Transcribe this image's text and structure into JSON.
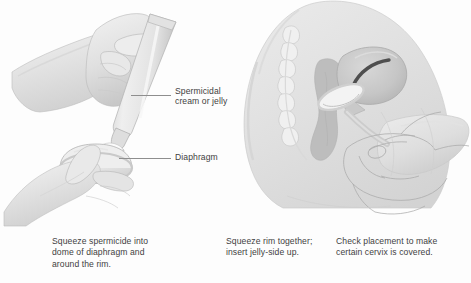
{
  "figure": {
    "style": {
      "background": "#fdfdfd",
      "text_color": "#3f3f3f",
      "leader_line_color": "#8e8e8e",
      "skin_tone_light": "#ededed",
      "skin_tone_mid": "#dcdcdc",
      "skin_tone_shadow": "#c6c6c6",
      "outline": "#9a9a9a",
      "anatomy_dark": "#b4b4b4",
      "cavity_dark": "#4a4a4a"
    }
  },
  "panels": [
    {
      "id": "panel-left",
      "name": "applying-spermicide-illustration",
      "description": "Hand squeezing a tube of spermicidal cream into the dome of a diaphragm held in the other hand",
      "labels": [
        {
          "id": "label-spermicide",
          "name": "label-spermicidal-cream",
          "text": "Spermicidal\ncream or jelly",
          "leader": {
            "id": "leader-spermicide",
            "name": "leader-line-spermicidal-cream"
          }
        },
        {
          "id": "label-diaphragm",
          "name": "label-diaphragm",
          "text": "Diaphragm",
          "leader": {
            "id": "leader-diaphragm",
            "name": "leader-line-diaphragm"
          }
        }
      ]
    },
    {
      "id": "panel-right",
      "name": "diaphragm-placement-illustration",
      "description": "Sagittal cross-section of female pelvis showing spine, rectum, uterus and a hand checking diaphragm placement over the cervix"
    }
  ],
  "captions": [
    {
      "id": "caption-1",
      "name": "caption-squeeze-spermicide",
      "text": "Squeeze spermicide into\ndome of diaphragm and\naround the rim."
    },
    {
      "id": "caption-2",
      "name": "caption-squeeze-rim",
      "text": "Squeeze rim together;\ninsert jelly-side up."
    },
    {
      "id": "caption-3",
      "name": "caption-check-placement",
      "text": "Check placement to make\ncertain cervix is covered."
    }
  ]
}
